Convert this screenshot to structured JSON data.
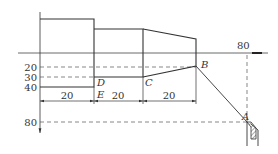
{
  "figure": {
    "colors": {
      "line": "#333333",
      "dash": "#555555",
      "background": "#ffffff"
    },
    "axis_labels": {
      "y20": "20",
      "y30": "30",
      "y40": "40",
      "y80": "80",
      "x80": "80"
    },
    "dimensions": [
      "20",
      "20",
      "20"
    ],
    "points": {
      "A": "A",
      "B": "B",
      "C": "C",
      "D": "D",
      "E": "E"
    }
  }
}
